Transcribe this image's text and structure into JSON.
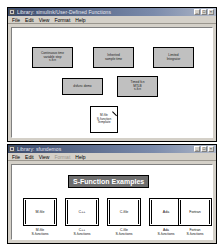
{
  "top_window": {
    "title": "Library: simulink/User-Defined Functions",
    "icon": "simulink-model-icon",
    "controls": {
      "minimize": "_",
      "maximize": "□",
      "close": "×"
    },
    "menu": [
      {
        "label": "File",
        "disabled": false
      },
      {
        "label": "Edit",
        "disabled": false
      },
      {
        "label": "View",
        "disabled": false
      },
      {
        "label": "Format",
        "disabled": false
      },
      {
        "label": "Help",
        "disabled": false
      }
    ],
    "blocks": [
      {
        "id": "continuous-time-variable-step-sfcn",
        "label": "Continuous time\nvariable step\ns-fcn"
      },
      {
        "id": "inherited-sample-time",
        "label": "Inherited\nsample time"
      },
      {
        "id": "limited-integrator",
        "label": "Limited\nIntegrator"
      },
      {
        "id": "dsfunc-discrete-states",
        "label": "dsfunc demo"
      },
      {
        "id": "timed-fcn-mtlb-sfcn",
        "label": "Timed fcn\nMTLB\ns-fcn"
      }
    ],
    "template_block": {
      "id": "mfile-sfunction-template",
      "label": "M-file\nS-function\nTemplate"
    }
  },
  "bottom_window": {
    "title": "Library: sfundemos",
    "icon": "simulink-model-icon",
    "controls": {
      "minimize": "_",
      "maximize": "□",
      "close": "×"
    },
    "menu": [
      {
        "label": "File",
        "disabled": false
      },
      {
        "label": "Edit",
        "disabled": false
      },
      {
        "label": "View",
        "disabled": false
      },
      {
        "label": "Format",
        "disabled": true
      },
      {
        "label": "Help",
        "disabled": false
      }
    ],
    "banner": "S-Function Examples",
    "examples": [
      {
        "id": "mfile-sfunctions",
        "face": "M-file",
        "caption": "M-file\nS-functions"
      },
      {
        "id": "cpp-sfunctions",
        "face": "C++",
        "caption": "C++\nS-functions"
      },
      {
        "id": "cfile-sfunctions",
        "face": "C-file",
        "caption": "C-file\nS-functions"
      },
      {
        "id": "ada-sfunctions",
        "face": "Ada",
        "caption": "Ada\nS-functions"
      },
      {
        "id": "fortran-sfunctions",
        "face": "Fortran",
        "caption": "Fortran\nS-functions"
      }
    ]
  },
  "colors": {
    "block_fill": "#c0c0c0",
    "window_face": "#d4d0c8",
    "titlebar_active": "#3a4a6b",
    "banner_fill": "#6e6e6e",
    "canvas": "#ffffff"
  }
}
